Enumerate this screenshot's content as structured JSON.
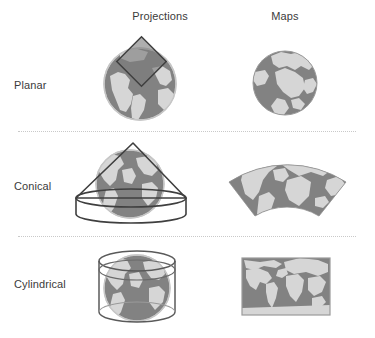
{
  "figure": {
    "column_headers": [
      {
        "id": "projections",
        "label": "Projections"
      },
      {
        "id": "maps",
        "label": "Maps"
      }
    ],
    "rows": [
      {
        "id": "planar",
        "label": "Planar",
        "projection": {
          "icon": "globe-with-tangent-plane-icon",
          "surface_shape": "plane",
          "description": "Globe with a flat square plane tangent at the pole"
        },
        "map": {
          "icon": "polar-azimuthal-map-icon",
          "outline_shape": "circle",
          "description": "Circular polar azimuthal world map"
        }
      },
      {
        "id": "conical",
        "label": "Conical",
        "projection": {
          "icon": "globe-with-cone-icon",
          "surface_shape": "cone",
          "description": "Globe enclosed by a cone tangent along a parallel"
        },
        "map": {
          "icon": "conic-fan-map-icon",
          "outline_shape": "annular-sector",
          "description": "Fan shaped conic world map"
        }
      },
      {
        "id": "cylindrical",
        "label": "Cylindrical",
        "projection": {
          "icon": "globe-with-cylinder-icon",
          "surface_shape": "cylinder",
          "description": "Globe enclosed by a cylinder tangent at the equator"
        },
        "map": {
          "icon": "rectangular-world-map-icon",
          "outline_shape": "rectangle",
          "description": "Rectangular equirectangular world map"
        }
      }
    ],
    "colors": {
      "ocean": "#828282",
      "land": "#d6d6d6",
      "globe_outline": "#bdbdbd",
      "shape_outline": "#4a4a4a",
      "map_border": "#9a9a9a",
      "text": "#3b3b3b",
      "divider": "#c9c9c9",
      "background": "#ffffff"
    }
  }
}
